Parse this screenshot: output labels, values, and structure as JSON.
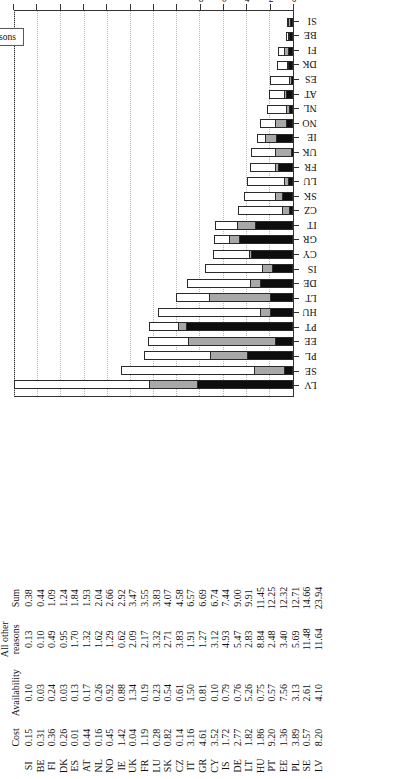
{
  "chart_data": {
    "type": "bar",
    "stacked": true,
    "orientation": "vertical-rotated-90ccw",
    "title": "",
    "xlabel": "",
    "ylabel": "% population who reported unmet needs",
    "ylim": [
      0,
      24
    ],
    "yticks": [
      0,
      2,
      4,
      6,
      8,
      10,
      12,
      14,
      16,
      18,
      20,
      22,
      24
    ],
    "grid": true,
    "legend_position": "top-right",
    "legend": [
      "Cost",
      "Availability",
      "All other reasons"
    ],
    "categories": [
      "LV",
      "SE",
      "PL",
      "EE",
      "PT",
      "HU",
      "LT",
      "DE",
      "IS",
      "CY",
      "GR",
      "IT",
      "CZ",
      "SK",
      "LU",
      "FR",
      "UK",
      "IE",
      "NO",
      "NL",
      "AT",
      "ES",
      "DK",
      "FI",
      "BE",
      "SI"
    ],
    "series": [
      {
        "name": "Cost",
        "color": "#0d0d0d",
        "values": [
          8.2,
          0.57,
          3.89,
          1.36,
          9.2,
          1.86,
          1.82,
          2.77,
          1.72,
          3.52,
          4.61,
          3.16,
          0.14,
          0.82,
          0.28,
          1.19,
          0.04,
          1.42,
          0.45,
          0.16,
          0.44,
          0.01,
          0.26,
          0.36,
          0.31,
          0.15
        ]
      },
      {
        "name": "Availability",
        "color": "#a8a8a8",
        "values": [
          4.1,
          2.61,
          3.13,
          7.56,
          0.57,
          0.75,
          5.26,
          0.76,
          0.79,
          0.1,
          0.81,
          1.5,
          0.61,
          0.54,
          0.23,
          0.19,
          1.34,
          0.88,
          0.92,
          0.26,
          0.17,
          0.13,
          0.03,
          0.24,
          0.03,
          0.1
        ]
      },
      {
        "name": "All other reasons",
        "color": "#ffffff",
        "values": [
          11.64,
          11.48,
          5.69,
          3.4,
          2.48,
          8.84,
          2.83,
          5.47,
          4.93,
          3.12,
          1.27,
          1.91,
          3.83,
          2.71,
          3.32,
          2.17,
          2.09,
          0.62,
          1.29,
          1.62,
          1.32,
          1.7,
          0.95,
          0.49,
          0.1,
          0.13
        ]
      }
    ],
    "sums": [
      23.94,
      14.66,
      12.71,
      12.32,
      12.25,
      11.45,
      9.91,
      9.0,
      7.44,
      6.74,
      6.69,
      6.57,
      4.58,
      4.07,
      3.83,
      3.55,
      3.47,
      2.92,
      2.66,
      2.04,
      1.93,
      1.84,
      1.24,
      1.09,
      0.44,
      0.38
    ]
  },
  "axis": {
    "y_title": "% population who reported unmet needs",
    "ticks": [
      "0",
      "2",
      "4",
      "6",
      "8",
      "10",
      "12",
      "14",
      "16",
      "18",
      "20",
      "22",
      "24"
    ]
  },
  "legend": {
    "items": [
      {
        "label": "Cost",
        "swatch": "cost-swatch"
      },
      {
        "label": "Availability",
        "swatch": "availability-swatch"
      },
      {
        "label": "All other reasons",
        "swatch": "all-other-reasons-swatch"
      }
    ]
  },
  "table": {
    "headers": {
      "country": "",
      "cost": "Cost",
      "availability": "Availability",
      "all_other_reasons_line1": "All other",
      "all_other_reasons_line2": "reasons",
      "sum": "Sum"
    },
    "rows": [
      {
        "country": "SI",
        "cost": "0.15",
        "availability": "0.10",
        "all_other": "0.13",
        "sum": "0.38"
      },
      {
        "country": "BE",
        "cost": "0.31",
        "availability": "0.03",
        "all_other": "0.10",
        "sum": "0.44"
      },
      {
        "country": "FI",
        "cost": "0.36",
        "availability": "0.24",
        "all_other": "0.49",
        "sum": "1.09"
      },
      {
        "country": "DK",
        "cost": "0.26",
        "availability": "0.03",
        "all_other": "0.95",
        "sum": "1.24"
      },
      {
        "country": "ES",
        "cost": "0.01",
        "availability": "0.13",
        "all_other": "1.70",
        "sum": "1.84"
      },
      {
        "country": "AT",
        "cost": "0.44",
        "availability": "0.17",
        "all_other": "1.32",
        "sum": "1.93"
      },
      {
        "country": "NL",
        "cost": "0.16",
        "availability": "0.26",
        "all_other": "1.62",
        "sum": "2.04"
      },
      {
        "country": "NO",
        "cost": "0.45",
        "availability": "0.92",
        "all_other": "1.29",
        "sum": "2.66"
      },
      {
        "country": "IE",
        "cost": "1.42",
        "availability": "0.88",
        "all_other": "0.62",
        "sum": "2.92"
      },
      {
        "country": "UK",
        "cost": "0.04",
        "availability": "1.34",
        "all_other": "2.09",
        "sum": "3.47"
      },
      {
        "country": "FR",
        "cost": "1.19",
        "availability": "0.19",
        "all_other": "2.17",
        "sum": "3.55"
      },
      {
        "country": "LU",
        "cost": "0.28",
        "availability": "0.23",
        "all_other": "3.32",
        "sum": "3.83"
      },
      {
        "country": "SK",
        "cost": "0.82",
        "availability": "0.54",
        "all_other": "2.71",
        "sum": "4.07"
      },
      {
        "country": "CZ",
        "cost": "0.14",
        "availability": "0.61",
        "all_other": "3.83",
        "sum": "4.58"
      },
      {
        "country": "IT",
        "cost": "3.16",
        "availability": "1.50",
        "all_other": "1.91",
        "sum": "6.57"
      },
      {
        "country": "GR",
        "cost": "4.61",
        "availability": "0.81",
        "all_other": "1.27",
        "sum": "6.69"
      },
      {
        "country": "CY",
        "cost": "3.52",
        "availability": "0.10",
        "all_other": "3.12",
        "sum": "6.74"
      },
      {
        "country": "IS",
        "cost": "1.72",
        "availability": "0.79",
        "all_other": "4.93",
        "sum": "7.44"
      },
      {
        "country": "DE",
        "cost": "2.77",
        "availability": "0.76",
        "all_other": "5.47",
        "sum": "9.00"
      },
      {
        "country": "LT",
        "cost": "1.82",
        "availability": "5.26",
        "all_other": "2.83",
        "sum": "9.91"
      },
      {
        "country": "HU",
        "cost": "1.86",
        "availability": "0.75",
        "all_other": "8.84",
        "sum": "11.45"
      },
      {
        "country": "PT",
        "cost": "9.20",
        "availability": "0.57",
        "all_other": "2.48",
        "sum": "12.25"
      },
      {
        "country": "EE",
        "cost": "1.36",
        "availability": "7.56",
        "all_other": "3.40",
        "sum": "12.32"
      },
      {
        "country": "PL",
        "cost": "3.89",
        "availability": "3.13",
        "all_other": "5.69",
        "sum": "12.71"
      },
      {
        "country": "SE",
        "cost": "0.57",
        "availability": "2.61",
        "all_other": "11.48",
        "sum": "14.66"
      },
      {
        "country": "LV",
        "cost": "8.20",
        "availability": "4.10",
        "all_other": "11.64",
        "sum": "23.94"
      }
    ]
  }
}
